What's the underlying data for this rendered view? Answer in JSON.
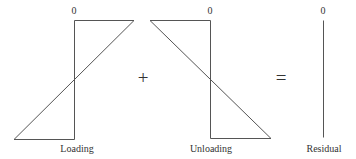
{
  "diagram": {
    "panels": [
      {
        "id": "loading",
        "zero_label": "0",
        "caption": "Loading"
      },
      {
        "id": "unloading",
        "zero_label": "0",
        "caption": "Unloading"
      },
      {
        "id": "residual",
        "zero_label": "0",
        "caption": "Residual"
      }
    ],
    "operators": {
      "plus": "+",
      "equals": "="
    },
    "colors": {
      "line": "#555555",
      "text": "#333333",
      "background": "#ffffff"
    }
  }
}
